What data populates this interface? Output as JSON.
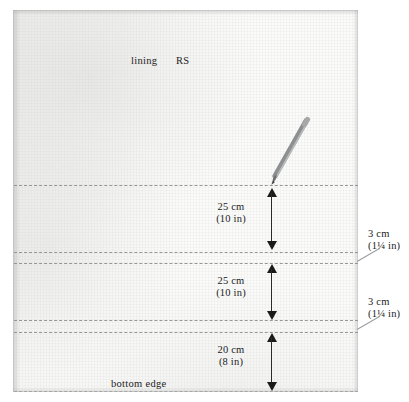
{
  "diagram": {
    "title_labels": {
      "fabric_name": "lining",
      "fabric_side": "RS",
      "bottom_edge": "bottom edge"
    },
    "measurements": [
      {
        "id": "segment-top",
        "metric": "25 cm",
        "imperial": "(10 in)"
      },
      {
        "id": "segment-middle",
        "metric": "25 cm",
        "imperial": "(10 in)"
      },
      {
        "id": "segment-bottom",
        "metric": "20 cm",
        "imperial": "(8 in)"
      }
    ],
    "callouts": [
      {
        "id": "callout-upper-band",
        "metric": "3 cm",
        "imperial": "(1¼ in)"
      },
      {
        "id": "callout-lower-band",
        "metric": "3 cm",
        "imperial": "(1¼ in)"
      }
    ],
    "colors": {
      "fabric": "#fbfbfa",
      "dashed_line": "#8e8f90",
      "arrow": "#1b1b1b",
      "text": "#1c1c1c",
      "pencil_body": "#8e8f91",
      "pencil_tip": "#4a4a4c"
    },
    "tools": [
      {
        "id": "marking-pencil",
        "name": "pencil"
      }
    ]
  }
}
